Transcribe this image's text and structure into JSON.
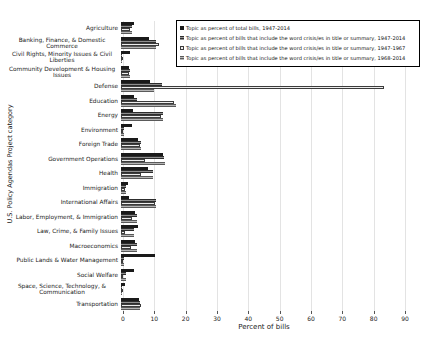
{
  "chart_data": {
    "type": "bar",
    "orientation": "horizontal",
    "title": "",
    "xlabel": "Percent of bills",
    "ylabel": "U.S. Policy Agendas Project category",
    "xlim": [
      0,
      90
    ],
    "xticks": [
      0,
      10,
      20,
      30,
      40,
      50,
      60,
      70,
      80,
      90
    ],
    "grid": true,
    "legend_position": "top-right",
    "categories": [
      "Agriculture",
      "Banking, Finance, & Domestic Commerce",
      "Civil Rights, Minority Issues & Civil Liberties",
      "Community Development & Housing Issues",
      "Defense",
      "Education",
      "Energy",
      "Environment",
      "Foreign Trade",
      "Government Operations",
      "Health",
      "Immigration",
      "International Affairs",
      "Labor, Employment, & Immigration",
      "Law, Crime, & Family Issues",
      "Macroeconomics",
      "Public Lands & Water Management",
      "Social Welfare",
      "Space, Science, Technology, & Communication",
      "Transportation"
    ],
    "series": [
      {
        "name": "Topic as percent of total bills, 1947-2014",
        "style": "solid-black",
        "color": "#1a1a1a",
        "values": [
          4.3,
          8.8,
          2.9,
          2.7,
          9.1,
          4.3,
          3.8,
          3.4,
          5.5,
          13.4,
          8.6,
          2.2,
          2.7,
          4.6,
          5.4,
          4.6,
          10.7,
          4.3,
          1.4,
          5.7
        ]
      },
      {
        "name": "Topic as percent of bills that include the word crisis/es in title or summary, 1947-2014",
        "style": "hatched-dark",
        "color": "#4d4d4d",
        "values": [
          3.5,
          11.3,
          0.4,
          2.9,
          13.0,
          5.2,
          13.4,
          1.0,
          6.5,
          13.8,
          10.2,
          1.6,
          11.3,
          5.1,
          4.3,
          5.1,
          0.8,
          1.6,
          0.3,
          6.1
        ]
      },
      {
        "name": "Topic as percent of bills that include the word crisis/es in title or summary, 1947-1967",
        "style": "light-outline",
        "color": "#ededed",
        "values": [
          2.9,
          12.2,
          0.2,
          2.5,
          84.0,
          16.8,
          12.7,
          0.3,
          6.2,
          7.8,
          6.5,
          1.3,
          10.8,
          3.5,
          1.4,
          3.3,
          0.2,
          0.6,
          0.2,
          6.5
        ]
      },
      {
        "name": "Topic as percent of bills that include the word crisis/es in title or summary, 1968-2014",
        "style": "hatched-medium",
        "color": "#9e9e9e",
        "values": [
          3.5,
          11.3,
          0.4,
          2.9,
          10.5,
          17.5,
          13.4,
          1.1,
          6.5,
          14.0,
          10.2,
          1.6,
          11.3,
          5.1,
          4.3,
          5.1,
          0.8,
          1.6,
          0.3,
          6.1
        ]
      }
    ]
  }
}
